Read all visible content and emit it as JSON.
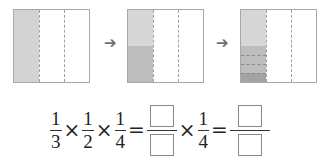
{
  "colors": {
    "border": "#a8a8a8",
    "shade_light": "#d3d3d3",
    "shade_medium": "#bdbdbd",
    "shade_dark": "#a3a3a3",
    "arrow": "#6f6f6f"
  },
  "panels": [
    {
      "label": "one-third shaded",
      "columns": 3,
      "shaded": "1/3"
    },
    {
      "label": "half of one-third shaded",
      "columns": 3,
      "shaded": "1/3 × 1/2"
    },
    {
      "label": "quarter of half of one-third shaded",
      "columns": 3,
      "shaded": "1/3 × 1/2 × 1/4"
    }
  ],
  "arrows": [
    "➔",
    "➔"
  ],
  "equation": {
    "fractions": [
      {
        "num": "1",
        "den": "3"
      },
      {
        "num": "1",
        "den": "2"
      },
      {
        "num": "1",
        "den": "4"
      }
    ],
    "times": "×",
    "equals": "=",
    "after_blank": {
      "num": "1",
      "den": "4"
    }
  }
}
